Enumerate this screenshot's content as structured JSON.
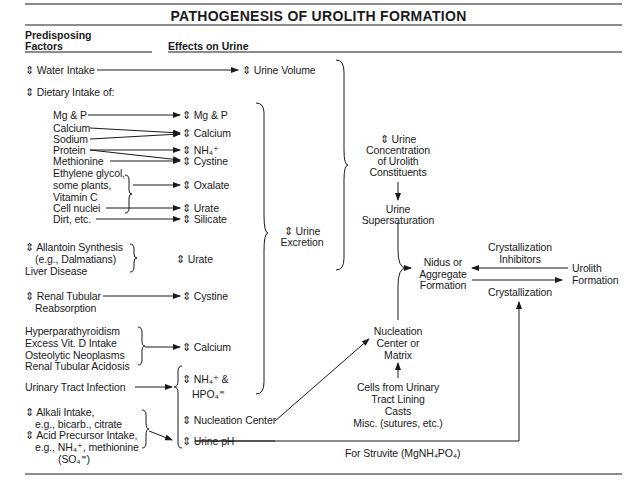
{
  "title": "PATHOGENESIS OF UROLITH FORMATION",
  "headers": {
    "predisposing_line1": "Predisposing",
    "predisposing_line2": "Factors",
    "effects": "Effects on Urine"
  },
  "arrow_glyph": "⇕",
  "factors": {
    "water_intake": "⇕ Water Intake",
    "dietary_intake": "⇕ Dietary Intake of:",
    "mg_p": "Mg & P",
    "calcium": "Calcium",
    "sodium": "Sodium",
    "protein": "Protein",
    "methionine": "Methionine",
    "ethylene_1": "Ethylene glycol,",
    "ethylene_2": "some plants,",
    "ethylene_3": "Vitamin C",
    "cell_nuclei": "Cell nuclei",
    "dirt": "Dirt, etc.",
    "allantoin_1": "⇕ Allantoin Synthesis",
    "allantoin_2": "(e.g., Dalmatians)",
    "allantoin_3": "Liver Disease",
    "renal_1": "⇕ Renal Tubular",
    "renal_2": "Reabsorption",
    "hyper_1": "Hyperparathyroidism",
    "hyper_2": "Excess Vit. D Intake",
    "hyper_3": "Osteolytic Neoplasms",
    "hyper_4": "Renal Tubular Acidosis",
    "uti": "Urinary Tract Infection",
    "alkali_1": "⇕ Alkali Intake,",
    "alkali_2": "e.g., bicarb., citrate",
    "acid_1": "⇕ Acid Precursor Intake,",
    "acid_2": "e.g., NH₄⁺, methionine",
    "acid_3": "(SO₄⁼)"
  },
  "effects": {
    "urine_volume": "⇕ Urine Volume",
    "mg_p": "⇕ Mg & P",
    "calcium": "⇕ Calcium",
    "nh4": "⇕ NH₄⁺",
    "cystine": "⇕ Cystine",
    "oxalate": "⇕ Oxalate",
    "urate": "⇕ Urate",
    "silicate": "⇕ Silicate",
    "urate2": "⇕ Urate",
    "cystine2": "⇕ Cystine",
    "calcium2": "⇕ Calcium",
    "nh4_hpo4_1": "⇕ NH₄⁺ &",
    "nh4_hpo4_2": "HPO₄⁼",
    "nucleation_center": "⇕ Nucleation Center",
    "urine_ph": "⇕ Urine pH"
  },
  "outcomes": {
    "urine_excretion_1": "⇕ Urine",
    "urine_excretion_2": "Excretion",
    "concentration_1": "⇕ Urine",
    "concentration_2": "Concentration",
    "concentration_3": "of Urolith",
    "concentration_4": "Constituents",
    "supersat_1": "Urine",
    "supersat_2": "Supersaturation",
    "nidus_1": "Nidus or",
    "nidus_2": "Aggregate",
    "nidus_3": "Formation",
    "inhib_1": "Crystallization",
    "inhib_2": "Inhibitors",
    "crystallization": "Crystallization",
    "urolith_1": "Urolith",
    "urolith_2": "Formation",
    "matrix_1": "Nucleation",
    "matrix_2": "Center or",
    "matrix_3": "Matrix",
    "cells_1": "Cells from Urinary",
    "cells_2": "Tract Lining",
    "cells_3": "Casts",
    "cells_4": "Misc. (sutures, etc.)",
    "struvite": "For Struvite (MgNH₄PO₄)"
  }
}
